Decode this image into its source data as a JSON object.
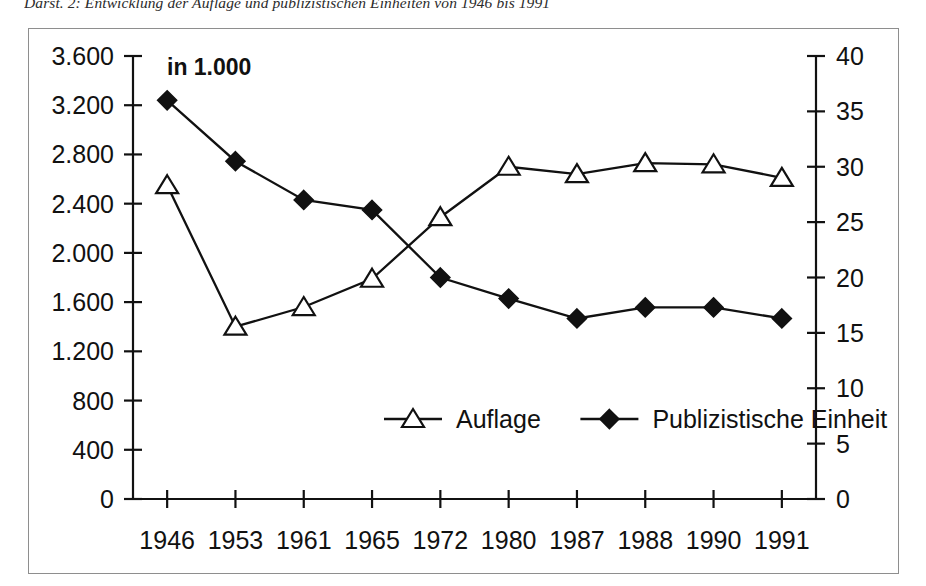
{
  "caption": {
    "text": "Darst. 2: Entwicklung der Auflage und publizistischen Einheiten von 1946 bis 1991"
  },
  "chart_data": {
    "type": "line",
    "title": "",
    "unit_note": "in 1.000",
    "xlabel": "",
    "ylabel": "",
    "grid": false,
    "legend_position": "inside-bottom-center",
    "categories": [
      "1946",
      "1953",
      "1961",
      "1965",
      "1972",
      "1980",
      "1987",
      "1988",
      "1990",
      "1991"
    ],
    "axes": {
      "left": {
        "label": "",
        "ylim": [
          0,
          3600
        ],
        "ticks": [
          "0",
          "400",
          "800",
          "1.200",
          "1.600",
          "2.000",
          "2.400",
          "2.800",
          "3.200",
          "3.600"
        ],
        "tick_values": [
          0,
          400,
          800,
          1200,
          1600,
          2000,
          2400,
          2800,
          3200,
          3600
        ]
      },
      "right": {
        "label": "",
        "ylim": [
          0,
          40
        ],
        "ticks": [
          "0",
          "5",
          "10",
          "15",
          "20",
          "25",
          "30",
          "35",
          "40"
        ],
        "tick_values": [
          0,
          5,
          10,
          15,
          20,
          25,
          30,
          35,
          40
        ]
      }
    },
    "series": [
      {
        "name": "Auflage",
        "axis": "left",
        "marker": "triangle-open",
        "color": "#111111",
        "values": [
          2550,
          1400,
          1560,
          1790,
          2290,
          2700,
          2640,
          2730,
          2720,
          2610
        ]
      },
      {
        "name": "Publizistische Einheit",
        "axis": "right",
        "marker": "diamond-filled",
        "color": "#111111",
        "values": [
          36.0,
          30.5,
          27.0,
          26.1,
          20.0,
          18.1,
          16.3,
          17.3,
          17.3,
          16.3
        ]
      }
    ]
  },
  "legend": {
    "items": [
      {
        "label": "Auflage",
        "marker": "triangle-open"
      },
      {
        "label": "Publizistische Einheit",
        "marker": "diamond-filled"
      }
    ]
  }
}
